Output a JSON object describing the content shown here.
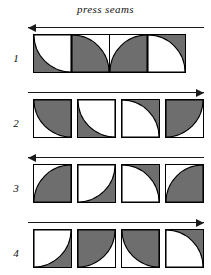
{
  "caption": "press seams",
  "colors": {
    "shaded": "#6e6e6e",
    "background": "#ffffff",
    "outline": "#000000",
    "arrow": "#1a1a1a"
  },
  "rows": [
    {
      "label": "1",
      "arrow": {
        "direction": "left",
        "name": "press-direction-arrow-left"
      },
      "joined": true,
      "blocks": [
        {
          "name": "quilt-block-r1c1",
          "base": "shaded",
          "quarter_circle": {
            "corner": "top-right",
            "fill": "light"
          }
        },
        {
          "name": "quilt-block-r1c2",
          "base": "light",
          "quarter_circle": {
            "corner": "bottom-left",
            "fill": "shaded"
          }
        },
        {
          "name": "quilt-block-r1c3",
          "base": "light",
          "quarter_circle": {
            "corner": "bottom-right",
            "fill": "shaded"
          }
        },
        {
          "name": "quilt-block-r1c4",
          "base": "shaded",
          "quarter_circle": {
            "corner": "bottom-left",
            "fill": "light"
          }
        }
      ]
    },
    {
      "label": "2",
      "arrow": {
        "direction": "right",
        "name": "press-direction-arrow-right"
      },
      "joined": false,
      "blocks": [
        {
          "name": "quilt-block-r2c1",
          "base": "light",
          "quarter_circle": {
            "corner": "top-right",
            "fill": "shaded"
          }
        },
        {
          "name": "quilt-block-r2c2",
          "base": "shaded",
          "quarter_circle": {
            "corner": "top-right",
            "fill": "light"
          }
        },
        {
          "name": "quilt-block-r2c3",
          "base": "shaded",
          "quarter_circle": {
            "corner": "bottom-left",
            "fill": "light"
          }
        },
        {
          "name": "quilt-block-r2c4",
          "base": "light",
          "quarter_circle": {
            "corner": "top-left",
            "fill": "shaded"
          }
        }
      ]
    },
    {
      "label": "3",
      "arrow": {
        "direction": "left",
        "name": "press-direction-arrow-left"
      },
      "joined": false,
      "blocks": [
        {
          "name": "quilt-block-r3c1",
          "base": "light",
          "quarter_circle": {
            "corner": "bottom-right",
            "fill": "shaded"
          }
        },
        {
          "name": "quilt-block-r3c2",
          "base": "shaded",
          "quarter_circle": {
            "corner": "top-left",
            "fill": "light"
          }
        },
        {
          "name": "quilt-block-r3c3",
          "base": "shaded",
          "quarter_circle": {
            "corner": "bottom-left",
            "fill": "light"
          }
        },
        {
          "name": "quilt-block-r3c4",
          "base": "light",
          "quarter_circle": {
            "corner": "bottom-right",
            "fill": "shaded"
          }
        }
      ]
    },
    {
      "label": "4",
      "arrow": {
        "direction": "right",
        "name": "press-direction-arrow-right"
      },
      "joined": false,
      "blocks": [
        {
          "name": "quilt-block-r4c1",
          "base": "shaded",
          "quarter_circle": {
            "corner": "top-left",
            "fill": "light"
          }
        },
        {
          "name": "quilt-block-r4c2",
          "base": "light",
          "quarter_circle": {
            "corner": "top-left",
            "fill": "shaded"
          }
        },
        {
          "name": "quilt-block-r4c3",
          "base": "light",
          "quarter_circle": {
            "corner": "top-right",
            "fill": "shaded"
          }
        },
        {
          "name": "quilt-block-r4c4",
          "base": "shaded",
          "quarter_circle": {
            "corner": "bottom-left",
            "fill": "light"
          }
        }
      ]
    }
  ]
}
